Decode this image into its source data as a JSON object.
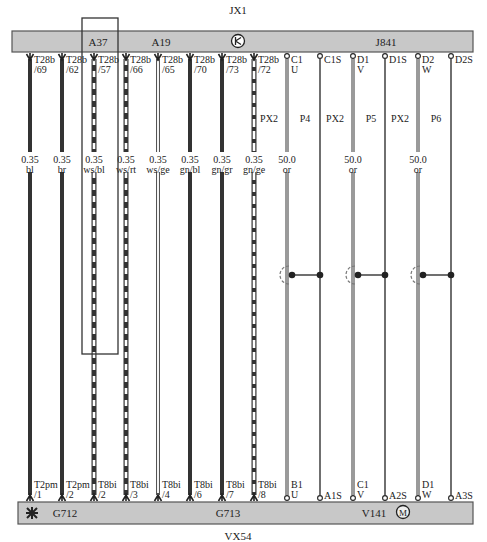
{
  "title_top": "JX1",
  "title_bottom": "VX54",
  "top_bar": {
    "labels": [
      {
        "text": "A37",
        "x": 98
      },
      {
        "text": "A19",
        "x": 161
      },
      {
        "text": "J841",
        "x": 386
      }
    ],
    "icon": "ground-point-icon"
  },
  "bottom_bar": {
    "labels": [
      {
        "text": "G712",
        "x": 65
      },
      {
        "text": "G713",
        "x": 228
      },
      {
        "text": "V141",
        "x": 374
      }
    ],
    "icons": [
      "sensor-icon",
      "motor-icon"
    ]
  },
  "colors": {
    "bar_fill": "#c8c8c8",
    "bar_stroke": "#555555",
    "wire_dark": "#333333",
    "wire_gray": "#9a9a9a",
    "wire_light": "#dddddd"
  },
  "wires": [
    {
      "x": 30,
      "top_pin": [
        "T28b",
        "/69"
      ],
      "gauge": "0.35",
      "color": "bl",
      "style": "dark",
      "bottom_pin": [
        "T2pm",
        "/1"
      ],
      "end": "arrow"
    },
    {
      "x": 62,
      "top_pin": [
        "T28b",
        "/62"
      ],
      "gauge": "0.35",
      "color": "br",
      "style": "dark",
      "bottom_pin": [
        "T2pm",
        "/2"
      ],
      "end": "arrow"
    },
    {
      "x": 94,
      "top_pin": [
        "T28b",
        "/57"
      ],
      "gauge": "0.35",
      "color": "ws/bl",
      "style": "dash-dark",
      "bottom_pin": [
        "T8bi",
        "/2"
      ],
      "end": "arrow"
    },
    {
      "x": 126,
      "top_pin": [
        "T28b",
        "/66"
      ],
      "gauge": "0.35",
      "color": "ws/rt",
      "style": "dash-dark",
      "bottom_pin": [
        "T8bi",
        "/3"
      ],
      "end": "arrow"
    },
    {
      "x": 158,
      "top_pin": [
        "T28b",
        "/65"
      ],
      "gauge": "0.35",
      "color": "ws/ge",
      "style": "light",
      "bottom_pin": [
        "T8bi",
        "/4"
      ],
      "end": "arrow"
    },
    {
      "x": 190,
      "top_pin": [
        "T28b",
        "/70"
      ],
      "gauge": "0.35",
      "color": "gn/bl",
      "style": "dark",
      "bottom_pin": [
        "T8bi",
        "/6"
      ],
      "end": "arrow"
    },
    {
      "x": 222,
      "top_pin": [
        "T28b",
        "/73"
      ],
      "gauge": "0.35",
      "color": "gn/gr",
      "style": "dark",
      "bottom_pin": [
        "T8bi",
        "/7"
      ],
      "end": "arrow"
    },
    {
      "x": 254,
      "top_pin": [
        "T28b",
        "/72"
      ],
      "gauge": "0.35",
      "color": "gn/ge",
      "style": "dash-dark2",
      "bottom_pin": [
        "T8bi",
        "/8"
      ],
      "end": "arrow"
    },
    {
      "x": 287,
      "top_pin": [
        "C1",
        "U"
      ],
      "gauge": "50.0",
      "color": "or",
      "style": "gray-thick",
      "bottom_pin": [
        "B1",
        "U"
      ],
      "end": "circle",
      "px": "PX2",
      "p": "P4"
    },
    {
      "x": 320,
      "top_pin": [
        "C1S",
        ""
      ],
      "gauge": "",
      "color": "",
      "style": "thin",
      "bottom_pin": [
        "A1S",
        ""
      ],
      "end": "circle"
    },
    {
      "x": 353,
      "top_pin": [
        "D1",
        "V"
      ],
      "gauge": "50.0",
      "color": "or",
      "style": "gray-thick",
      "bottom_pin": [
        "C1",
        "V"
      ],
      "end": "circle",
      "px": "PX2",
      "p": "P5"
    },
    {
      "x": 385,
      "top_pin": [
        "D1S",
        ""
      ],
      "gauge": "",
      "color": "",
      "style": "thin",
      "bottom_pin": [
        "A2S",
        ""
      ],
      "end": "circle"
    },
    {
      "x": 418,
      "top_pin": [
        "D2",
        "W"
      ],
      "gauge": "50.0",
      "color": "or",
      "style": "gray-thick",
      "bottom_pin": [
        "D1",
        "W"
      ],
      "end": "circle",
      "px": "PX2",
      "p": "P6"
    },
    {
      "x": 451,
      "top_pin": [
        "D2S",
        ""
      ],
      "gauge": "",
      "color": "",
      "style": "thin",
      "bottom_pin": [
        "A3S",
        ""
      ],
      "end": "circle"
    }
  ],
  "shield_junctions": [
    {
      "wire_x": 287,
      "shield_x": 320,
      "y": 275
    },
    {
      "wire_x": 353,
      "shield_x": 385,
      "y": 275
    },
    {
      "wire_x": 418,
      "shield_x": 451,
      "y": 275
    }
  ],
  "highlight_box": {
    "x": 82,
    "y": 18,
    "w": 36,
    "h": 336
  }
}
